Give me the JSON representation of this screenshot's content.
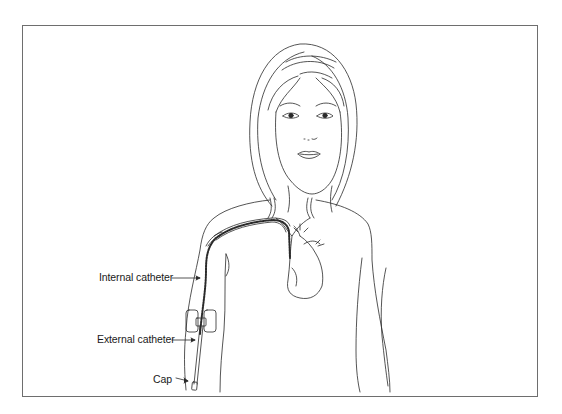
{
  "figure": {
    "labels": {
      "internal_catheter": "Internal catheter",
      "external_catheter": "External catheter",
      "cap": "Cap"
    },
    "colors": {
      "line": "#2a2a2a",
      "frame": "#6e6e6e",
      "background": "#ffffff"
    }
  }
}
